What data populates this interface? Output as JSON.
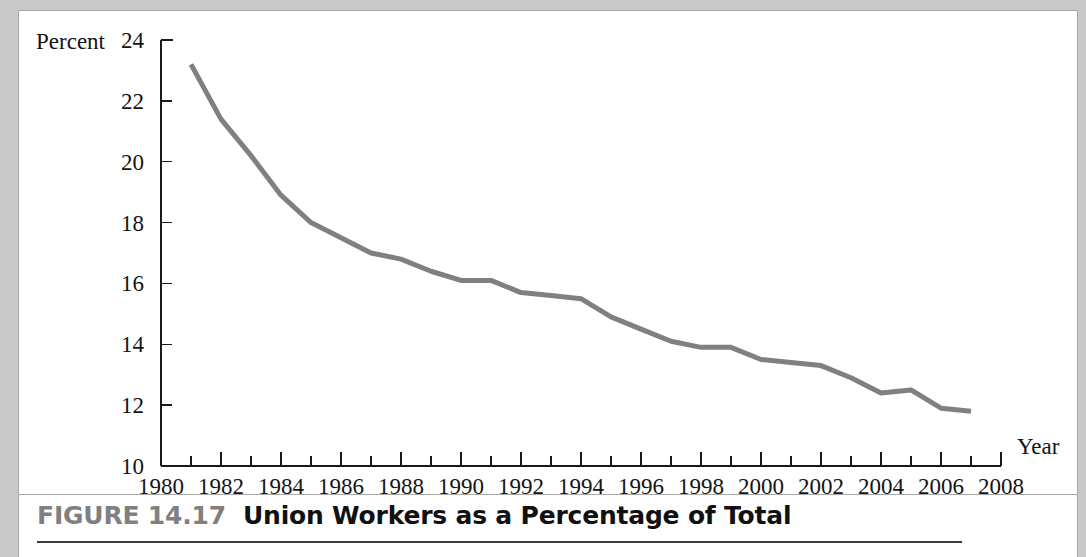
{
  "figure": {
    "number_label": "FIGURE 14.17",
    "title": "Union Workers as a Percentage of Total"
  },
  "chart_data": {
    "type": "line",
    "title": "Union Workers as a Percentage of Total",
    "xlabel": "Year",
    "ylabel": "Percent",
    "xlim": [
      1980,
      2008
    ],
    "ylim": [
      10,
      24
    ],
    "x_tick_labels": [
      "1980",
      "1982",
      "1984",
      "1986",
      "1988",
      "1990",
      "1992",
      "1994",
      "1996",
      "1998",
      "2000",
      "2002",
      "2004",
      "2006",
      "2008"
    ],
    "x_tick_values": [
      1980,
      1982,
      1984,
      1986,
      1988,
      1990,
      1992,
      1994,
      1996,
      1998,
      2000,
      2002,
      2004,
      2006,
      2008
    ],
    "x_minor_tick_step": 1,
    "y_tick_labels": [
      "10",
      "12",
      "14",
      "16",
      "18",
      "20",
      "22",
      "24"
    ],
    "y_tick_values": [
      10,
      12,
      14,
      16,
      18,
      20,
      22,
      24
    ],
    "grid": false,
    "legend": false,
    "line_color": "#808080",
    "line_width": 5,
    "x": [
      1981,
      1982,
      1983,
      1984,
      1985,
      1986,
      1987,
      1988,
      1989,
      1990,
      1991,
      1992,
      1993,
      1994,
      1995,
      1996,
      1997,
      1998,
      1999,
      2000,
      2001,
      2002,
      2003,
      2004,
      2005,
      2006,
      2007
    ],
    "values": [
      23.2,
      21.4,
      20.2,
      18.9,
      18.0,
      17.5,
      17.0,
      16.8,
      16.4,
      16.1,
      16.1,
      15.7,
      15.6,
      15.5,
      14.9,
      14.5,
      14.1,
      13.9,
      13.9,
      13.5,
      13.4,
      13.3,
      12.9,
      12.4,
      12.5,
      11.9,
      11.8
    ],
    "series": [
      {
        "name": "Union workers as a percentage of total",
        "values": [
          23.2,
          21.4,
          20.2,
          18.9,
          18.0,
          17.5,
          17.0,
          16.8,
          16.4,
          16.1,
          16.1,
          15.7,
          15.6,
          15.5,
          14.9,
          14.5,
          14.1,
          13.9,
          13.9,
          13.5,
          13.4,
          13.3,
          12.9,
          12.4,
          12.5,
          11.9,
          11.8
        ]
      }
    ]
  }
}
